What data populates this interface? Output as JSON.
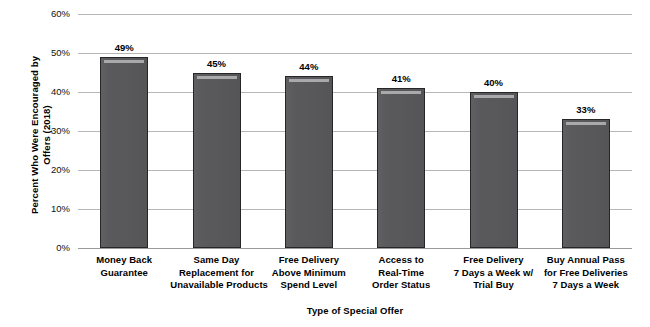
{
  "chart_data": {
    "type": "bar",
    "title": "",
    "xlabel": "Type of Special Offer",
    "ylabel": "Percent Who Were Encouraged by Offers (2018)",
    "ylabel_lines": [
      "Percent Who Were Encouraged by",
      "Offers (2018)"
    ],
    "categories": [
      "Money Back Guarantee",
      "Same Day Replacement for Unavailable Products",
      "Free Delivery Above Minimum Spend Level",
      "Access to Real-Time Order Status",
      "Free Delivery 7 Days a Week w/ Trial Buy",
      "Buy Annual Pass for Free Deliveries 7 Days a Week"
    ],
    "category_lines": [
      [
        "Money Back",
        "Guarantee"
      ],
      [
        "Same Day",
        "Replacement for",
        "Unavailable Products"
      ],
      [
        "Free Delivery",
        "Above Minimum",
        "Spend Level"
      ],
      [
        "Access to",
        "Real-Time",
        "Order Status"
      ],
      [
        "Free Delivery",
        "7 Days a Week w/",
        "Trial Buy"
      ],
      [
        "Buy Annual Pass",
        "for Free Deliveries",
        "7 Days a Week"
      ]
    ],
    "values": [
      49,
      45,
      44,
      41,
      40,
      33
    ],
    "value_labels": [
      "49%",
      "45%",
      "44%",
      "41%",
      "40%",
      "33%"
    ],
    "ylim": [
      0,
      60
    ],
    "ytick_values": [
      60,
      50,
      40,
      30,
      20,
      10,
      0
    ],
    "ytick_labels": [
      "60%",
      "50%",
      "40%",
      "30%",
      "20%",
      "10%",
      "0%"
    ],
    "grid": true,
    "legend": "none",
    "bar_color": "#58585a",
    "bar_border_color": "#262626",
    "gridline_color": "#b6b6b6",
    "background_color": "#ffffff"
  }
}
